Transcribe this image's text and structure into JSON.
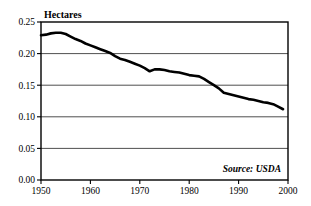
{
  "chart_data": {
    "type": "line",
    "title": "",
    "subtitle": "",
    "ylabel": "Hectares",
    "xlabel": "",
    "annotation": "Source: USDA",
    "grid": "horizontal",
    "legend": "none",
    "xlim": [
      1950,
      2000
    ],
    "ylim": [
      0.0,
      0.25
    ],
    "xticks": [
      1950,
      1960,
      1970,
      1980,
      1990,
      2000
    ],
    "xtick_labels": [
      "1950",
      "1960",
      "1970",
      "1980",
      "1990",
      "2000"
    ],
    "yticks": [
      0.0,
      0.05,
      0.1,
      0.15,
      0.2,
      0.25
    ],
    "ytick_labels": [
      "0.00",
      "0.05",
      "0.10",
      "0.15",
      "0.20",
      "0.25"
    ],
    "series": [
      {
        "name": "Grainland per person",
        "color": "#000000",
        "x": [
          1950,
          1951,
          1952,
          1953,
          1954,
          1955,
          1956,
          1957,
          1958,
          1959,
          1960,
          1961,
          1962,
          1963,
          1964,
          1965,
          1966,
          1967,
          1968,
          1969,
          1970,
          1971,
          1972,
          1973,
          1974,
          1975,
          1976,
          1977,
          1978,
          1979,
          1980,
          1981,
          1982,
          1983,
          1984,
          1985,
          1986,
          1987,
          1988,
          1989,
          1990,
          1991,
          1992,
          1993,
          1994,
          1995,
          1996,
          1997,
          1998,
          1999
        ],
        "values": [
          0.229,
          0.23,
          0.232,
          0.233,
          0.233,
          0.231,
          0.227,
          0.223,
          0.22,
          0.216,
          0.213,
          0.21,
          0.207,
          0.204,
          0.201,
          0.196,
          0.192,
          0.19,
          0.187,
          0.184,
          0.181,
          0.177,
          0.172,
          0.175,
          0.175,
          0.174,
          0.172,
          0.171,
          0.17,
          0.168,
          0.166,
          0.165,
          0.164,
          0.16,
          0.155,
          0.15,
          0.145,
          0.138,
          0.136,
          0.134,
          0.132,
          0.13,
          0.128,
          0.127,
          0.125,
          0.123,
          0.122,
          0.12,
          0.116,
          0.112
        ]
      }
    ]
  }
}
